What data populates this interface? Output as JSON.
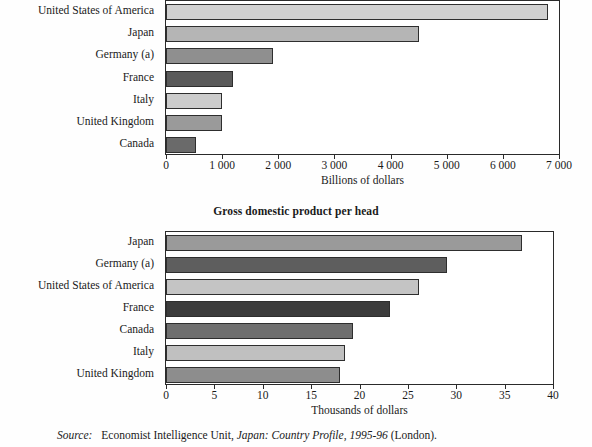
{
  "chart_data": [
    {
      "type": "bar",
      "orientation": "horizontal",
      "title": "",
      "categories": [
        "United States of America",
        "Japan",
        "Germany (a)",
        "France",
        "Italy",
        "United Kingdom",
        "Canada"
      ],
      "values": [
        6800,
        4500,
        1900,
        1190,
        990,
        990,
        530
      ],
      "bar_colors": [
        "#d0d0d0",
        "#b5b5b5",
        "#8f8f8f",
        "#5a5a5a",
        "#cccccc",
        "#9a9a9a",
        "#6a6a6a"
      ],
      "xlabel": "Billions of dollars",
      "ylabel": "",
      "xlim": [
        0,
        7000
      ],
      "xticks": [
        0,
        1000,
        2000,
        3000,
        4000,
        5000,
        6000,
        7000
      ],
      "xticklabels": [
        "0",
        "1 000",
        "2 000",
        "3 000",
        "4 000",
        "5 000",
        "6 000",
        "7 000"
      ],
      "grid": false,
      "legend": "none"
    },
    {
      "type": "bar",
      "orientation": "horizontal",
      "title": "Gross domestic product per head",
      "categories": [
        "Japan",
        "Germany (a)",
        "United States of America",
        "France",
        "Canada",
        "Italy",
        "United Kingdom"
      ],
      "values": [
        36.8,
        29.0,
        26.2,
        23.2,
        19.3,
        18.5,
        18.0
      ],
      "bar_colors": [
        "#9a9a9a",
        "#5e5e5e",
        "#c4c4c4",
        "#3c3c3c",
        "#6f6f6f",
        "#c0c0c0",
        "#8d8d8d"
      ],
      "xlabel": "Thousands of dollars",
      "ylabel": "",
      "xlim": [
        0,
        40
      ],
      "xticks": [
        0,
        5,
        10,
        15,
        20,
        25,
        30,
        35,
        40
      ],
      "xticklabels": [
        "0",
        "5",
        "10",
        "15",
        "20",
        "25",
        "30",
        "35",
        "40"
      ],
      "grid": false,
      "legend": "none"
    }
  ],
  "source": {
    "label": "Source:",
    "publisher": "Economist Intelligence Unit,",
    "title_italic": "Japan: Country Profile, 1995-96",
    "place": "(London)."
  }
}
